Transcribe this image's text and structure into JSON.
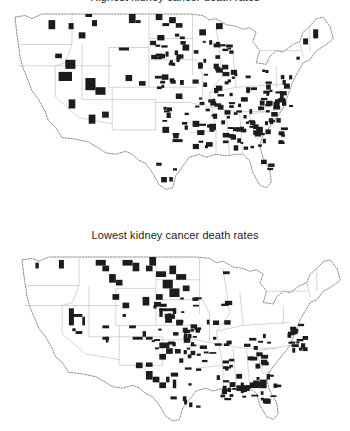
{
  "figure": {
    "top_map": {
      "title": "Highest kidney cancer death rates",
      "title_clipped": true,
      "marked_color": "#1c1c1c",
      "description": "US counties with highest kidney cancer death rates (shaded)"
    },
    "bottom_map": {
      "title": "Lowest kidney cancer death rates",
      "marked_color": "#1c1c1c",
      "description": "US counties with lowest kidney cancer death rates (shaded)"
    },
    "outline_color": "#6a6a6a",
    "state_border_color": "#b8b8b8",
    "background": "#ffffff"
  }
}
